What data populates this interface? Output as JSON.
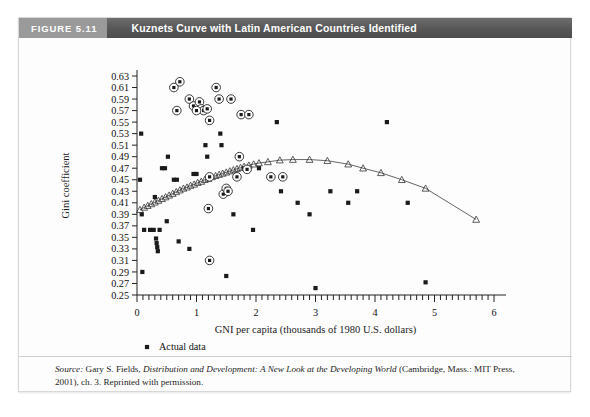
{
  "figure": {
    "number_label": "FIGURE 5.11",
    "title": "Kuznets Curve with Latin American Countries Identified"
  },
  "source": {
    "label": "Source:",
    "author": " Gary S. Fields, ",
    "work": "Distribution and Development: A New Look at the Developing World",
    "publication": " (Cambridge, Mass.: MIT Press, 2001), ch. 3. Reprinted with permission."
  },
  "colors": {
    "header_dark": "#565656",
    "header_light": "#9a9a9a",
    "header_text": "#ffffff",
    "axis": "#222222",
    "marker": "#1a1a1a",
    "curve": "#555555",
    "frame": "#d8d8d8",
    "page": "#ffffff"
  },
  "legend": {
    "position": "below-axis-left",
    "items": [
      {
        "marker": "filled-square",
        "label": "Actual data"
      },
      {
        "marker": "open-triangle",
        "label": "Predicted relationship"
      },
      {
        "marker": "circled-dot",
        "label": "Latin American country"
      }
    ]
  },
  "chart_data": {
    "type": "scatter",
    "title": "Kuznets Curve with Latin American Countries Identified",
    "xlabel": "GNI per capita (thousands of 1980 U.S. dollars)",
    "ylabel": "Gini coefficient",
    "xlim": [
      0,
      6
    ],
    "ylim": [
      0.25,
      0.63
    ],
    "xticks": [
      0,
      1,
      2,
      3,
      4,
      5,
      6
    ],
    "xtick_labels": [
      "0",
      "1",
      "2",
      "3",
      "4",
      "5",
      "6"
    ],
    "x_minor_tick_step": 0.1,
    "yticks": [
      0.25,
      0.27,
      0.29,
      0.31,
      0.33,
      0.35,
      0.37,
      0.39,
      0.41,
      0.43,
      0.45,
      0.47,
      0.49,
      0.51,
      0.53,
      0.55,
      0.57,
      0.59,
      0.61,
      0.63
    ],
    "ytick_labels": [
      "0.25",
      "0.27",
      "0.29",
      "0.31",
      "0.33",
      "0.35",
      "0.37",
      "0.39",
      "0.41",
      "0.43",
      "0.45",
      "0.47",
      "0.49",
      "0.51",
      "0.53",
      "0.55",
      "0.57",
      "0.59",
      "0.61",
      "0.63"
    ],
    "grid": false,
    "legend_position": "below plot, left aligned",
    "series": [
      {
        "name": "Actual data",
        "marker": "filled-square",
        "points": [
          [
            0.05,
            0.45
          ],
          [
            0.07,
            0.53
          ],
          [
            0.08,
            0.39
          ],
          [
            0.09,
            0.29
          ],
          [
            0.12,
            0.363
          ],
          [
            0.22,
            0.363
          ],
          [
            0.28,
            0.363
          ],
          [
            0.3,
            0.42
          ],
          [
            0.32,
            0.348
          ],
          [
            0.33,
            0.34
          ],
          [
            0.34,
            0.333
          ],
          [
            0.35,
            0.326
          ],
          [
            0.38,
            0.363
          ],
          [
            0.42,
            0.47
          ],
          [
            0.47,
            0.47
          ],
          [
            0.5,
            0.378
          ],
          [
            0.52,
            0.49
          ],
          [
            0.62,
            0.45
          ],
          [
            0.67,
            0.45
          ],
          [
            0.7,
            0.343
          ],
          [
            0.88,
            0.33
          ],
          [
            0.95,
            0.46
          ],
          [
            1.0,
            0.46
          ],
          [
            1.15,
            0.51
          ],
          [
            1.18,
            0.49
          ],
          [
            1.4,
            0.53
          ],
          [
            1.42,
            0.51
          ],
          [
            1.5,
            0.283
          ],
          [
            1.62,
            0.39
          ],
          [
            1.8,
            0.47
          ],
          [
            1.95,
            0.363
          ],
          [
            2.05,
            0.47
          ],
          [
            2.35,
            0.55
          ],
          [
            2.42,
            0.43
          ],
          [
            2.7,
            0.41
          ],
          [
            2.9,
            0.39
          ],
          [
            3.0,
            0.262
          ],
          [
            3.25,
            0.43
          ],
          [
            3.55,
            0.41
          ],
          [
            3.7,
            0.43
          ],
          [
            4.2,
            0.55
          ],
          [
            4.55,
            0.41
          ],
          [
            4.85,
            0.272
          ]
        ]
      },
      {
        "name": "Predicted relationship",
        "marker": "open-triangle",
        "line": true,
        "points": [
          [
            0.05,
            0.398
          ],
          [
            0.12,
            0.402
          ],
          [
            0.18,
            0.405
          ],
          [
            0.24,
            0.408
          ],
          [
            0.3,
            0.411
          ],
          [
            0.36,
            0.414
          ],
          [
            0.42,
            0.417
          ],
          [
            0.48,
            0.42
          ],
          [
            0.54,
            0.423
          ],
          [
            0.6,
            0.426
          ],
          [
            0.66,
            0.429
          ],
          [
            0.72,
            0.432
          ],
          [
            0.78,
            0.435
          ],
          [
            0.84,
            0.437
          ],
          [
            0.9,
            0.44
          ],
          [
            0.96,
            0.442
          ],
          [
            1.02,
            0.445
          ],
          [
            1.08,
            0.447
          ],
          [
            1.14,
            0.45
          ],
          [
            1.2,
            0.452
          ],
          [
            1.26,
            0.455
          ],
          [
            1.32,
            0.457
          ],
          [
            1.38,
            0.459
          ],
          [
            1.44,
            0.461
          ],
          [
            1.5,
            0.463
          ],
          [
            1.56,
            0.465
          ],
          [
            1.62,
            0.467
          ],
          [
            1.68,
            0.469
          ],
          [
            1.74,
            0.471
          ],
          [
            1.8,
            0.473
          ],
          [
            1.88,
            0.475
          ],
          [
            1.96,
            0.477
          ],
          [
            2.05,
            0.479
          ],
          [
            2.2,
            0.481
          ],
          [
            2.4,
            0.484
          ],
          [
            2.62,
            0.485
          ],
          [
            2.9,
            0.485
          ],
          [
            3.2,
            0.483
          ],
          [
            3.55,
            0.477
          ],
          [
            3.8,
            0.47
          ],
          [
            4.1,
            0.462
          ],
          [
            4.45,
            0.45
          ],
          [
            4.85,
            0.435
          ],
          [
            5.7,
            0.381
          ]
        ]
      },
      {
        "name": "Latin American country",
        "marker": "circled-dot",
        "points": [
          [
            0.72,
            0.62
          ],
          [
            0.88,
            0.59
          ],
          [
            0.95,
            0.578
          ],
          [
            1.05,
            0.585
          ],
          [
            1.08,
            0.573
          ],
          [
            1.12,
            0.57
          ],
          [
            1.0,
            0.57
          ],
          [
            1.18,
            0.573
          ],
          [
            1.22,
            0.553
          ],
          [
            1.33,
            0.61
          ],
          [
            1.38,
            0.59
          ],
          [
            1.58,
            0.59
          ],
          [
            1.75,
            0.563
          ],
          [
            1.88,
            0.563
          ],
          [
            1.22,
            0.455
          ],
          [
            1.45,
            0.425
          ],
          [
            1.5,
            0.435
          ],
          [
            1.53,
            0.43
          ],
          [
            1.68,
            0.455
          ],
          [
            1.72,
            0.49
          ],
          [
            1.2,
            0.4
          ],
          [
            1.22,
            0.31
          ],
          [
            1.85,
            0.468
          ],
          [
            2.25,
            0.455
          ],
          [
            2.45,
            0.455
          ],
          [
            0.62,
            0.61
          ],
          [
            0.67,
            0.57
          ]
        ]
      }
    ]
  }
}
